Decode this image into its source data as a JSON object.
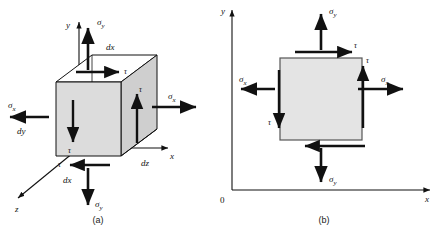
{
  "figure": {
    "background_color": "#ffffff",
    "line_color": "#111111",
    "face_fill_front": "#d6d6d6",
    "face_fill_side": "#c9c9c9",
    "face_fill_top": "#ffffff",
    "square_fill": "#e4e4e4"
  },
  "panels": [
    {
      "id": "a",
      "caption": "(a)",
      "type": "three-dimensional-stress-element",
      "axes": [
        {
          "name": "y-axis",
          "label": "y",
          "direction": "up"
        },
        {
          "name": "x-axis",
          "label": "x",
          "direction": "right"
        },
        {
          "name": "z-axis",
          "label": "z",
          "direction": "down-left"
        }
      ],
      "dimensions": [
        {
          "name": "dx-top",
          "label": "dx"
        },
        {
          "name": "dy-left",
          "label": "dy"
        },
        {
          "name": "dz-right",
          "label": "dz"
        },
        {
          "name": "dx-bottom",
          "label": "dx"
        }
      ],
      "stresses": [
        {
          "name": "sigma-y-top",
          "symbol": "σ",
          "subscript": "y",
          "direction": "up"
        },
        {
          "name": "sigma-y-bottom",
          "symbol": "σ",
          "subscript": "y",
          "direction": "down"
        },
        {
          "name": "sigma-x-left",
          "symbol": "σ",
          "subscript": "x",
          "direction": "left"
        },
        {
          "name": "sigma-x-right",
          "symbol": "σ",
          "subscript": "x",
          "direction": "right"
        }
      ],
      "shears": [
        {
          "name": "tau-top",
          "symbol": "τ",
          "direction": "right"
        },
        {
          "name": "tau-right",
          "symbol": "τ",
          "direction": "up"
        },
        {
          "name": "tau-left",
          "symbol": "τ",
          "direction": "down"
        },
        {
          "name": "tau-bottom",
          "symbol": "τ",
          "direction": "left"
        }
      ]
    },
    {
      "id": "b",
      "caption": "(b)",
      "type": "two-dimensional-stress-element",
      "axes": [
        {
          "name": "y-axis",
          "label": "y",
          "direction": "up"
        },
        {
          "name": "x-axis",
          "label": "x",
          "direction": "right"
        }
      ],
      "origin_label": "0",
      "stresses": [
        {
          "name": "sigma-y-top",
          "symbol": "σ",
          "subscript": "y",
          "direction": "up"
        },
        {
          "name": "sigma-y-bottom",
          "symbol": "σ",
          "subscript": "y",
          "direction": "down"
        },
        {
          "name": "sigma-x-left",
          "symbol": "σ",
          "subscript": "x",
          "direction": "left"
        },
        {
          "name": "sigma-x-right",
          "symbol": "σ",
          "subscript": "x",
          "direction": "right"
        }
      ],
      "shears": [
        {
          "name": "tau-top",
          "symbol": "τ",
          "direction": "right"
        },
        {
          "name": "tau-right",
          "symbol": "τ",
          "direction": "up"
        },
        {
          "name": "tau-left",
          "symbol": "τ",
          "direction": "down"
        },
        {
          "name": "tau-bottom",
          "symbol": "",
          "direction": "left"
        }
      ]
    }
  ],
  "glyphs": {
    "sigma": "σ",
    "tau": "τ"
  }
}
